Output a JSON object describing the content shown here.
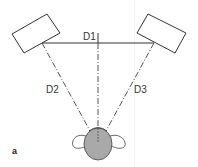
{
  "diagram": {
    "labels": {
      "d1": "D1",
      "d2": "D2",
      "d3": "D3",
      "figure": "a"
    },
    "elements": {
      "left_speaker": "speaker",
      "right_speaker": "speaker",
      "listener": "listener head (top view)"
    },
    "colors": {
      "line": "#333333",
      "head_fill": "#a9a9a9",
      "background": "#ffffff"
    }
  }
}
